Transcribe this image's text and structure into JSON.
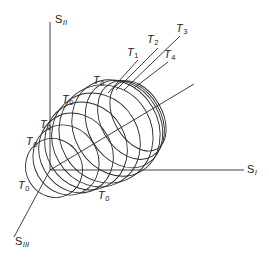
{
  "diagram": {
    "type": "3D principal stress space yield surface evolution",
    "axes": [
      {
        "id": "s1",
        "label": "S",
        "subscript": "I"
      },
      {
        "id": "s2",
        "label": "S",
        "subscript": "II"
      },
      {
        "id": "s3",
        "label": "S",
        "subscript": "III"
      }
    ],
    "isotherm_labels": [
      {
        "label": "T",
        "subscript": "0"
      },
      {
        "label": "T",
        "subscript": "0"
      },
      {
        "label": "T",
        "subscript": "0"
      },
      {
        "label": "T",
        "subscript": "0"
      },
      {
        "label": "T",
        "subscript": "0"
      },
      {
        "label": "T",
        "subscript": "0"
      },
      {
        "label": "T",
        "subscript": "1"
      },
      {
        "label": "T",
        "subscript": "2"
      },
      {
        "label": "T",
        "subscript": "3"
      },
      {
        "label": "T",
        "subscript": "4"
      }
    ],
    "line_color": "#2a2a2a",
    "background": "#ffffff"
  }
}
